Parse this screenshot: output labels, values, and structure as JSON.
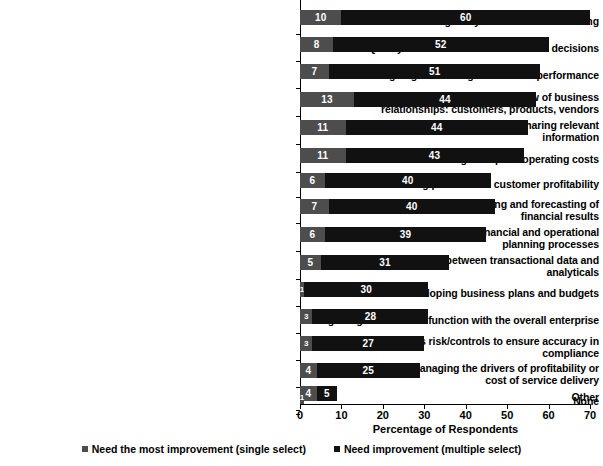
{
  "chart_data": {
    "type": "bar",
    "orientation": "horizontal",
    "stacked": true,
    "title": "",
    "xlabel": "Percentage of Respondents",
    "ylabel": "",
    "xlim": [
      0,
      70
    ],
    "xticks": [
      "0",
      "10",
      "20",
      "30",
      "40",
      "50",
      "60",
      "70"
    ],
    "grid": false,
    "legend_position": "bottom",
    "colors": {
      "series_a": "#4d4d4d",
      "series_b": "#111111",
      "background": "#ffffff",
      "text": "#000000"
    },
    "categories": [
      "Facilitating analysis and decision making",
      "Quality of the data used for business decisions",
      "Ongoing monitoring of business performance",
      "Creating/maintaining an enterprisewide view of business relationships: customers, products, vendors",
      "Creating an effective environment for sharing relevant information",
      "Reducing enterprise operating costs",
      "Measuring product and customer profitability",
      "Creating more accurate planning and forecasting of financial results",
      "More closely relating strategic financial and operational planning processes",
      "Ensuring consistency between transactional data and analyticals",
      "Developing business plans and budgets",
      "Integrating the financial function with the overall enterprise",
      "Managing business risk/controls to ensure accuracy in compliance",
      "Understanding and managing the drivers of profitability or cost of service delivery",
      "Other",
      "None"
    ],
    "series": [
      {
        "name": "Need the most improvement (single select)",
        "values": [
          10,
          8,
          7,
          13,
          11,
          11,
          6,
          7,
          6,
          5,
          1,
          3,
          3,
          4,
          4,
          1
        ]
      },
      {
        "name": "Need improvement (multiple select)",
        "values": [
          60,
          52,
          51,
          44,
          44,
          43,
          40,
          40,
          39,
          31,
          30,
          28,
          27,
          25,
          5,
          0
        ]
      }
    ]
  },
  "legend": {
    "items": [
      {
        "label": "Need the most improvement (single select)",
        "marker": "square-marker-gray"
      },
      {
        "label": "Need improvement (multiple select)",
        "marker": "square-marker-black"
      }
    ]
  }
}
